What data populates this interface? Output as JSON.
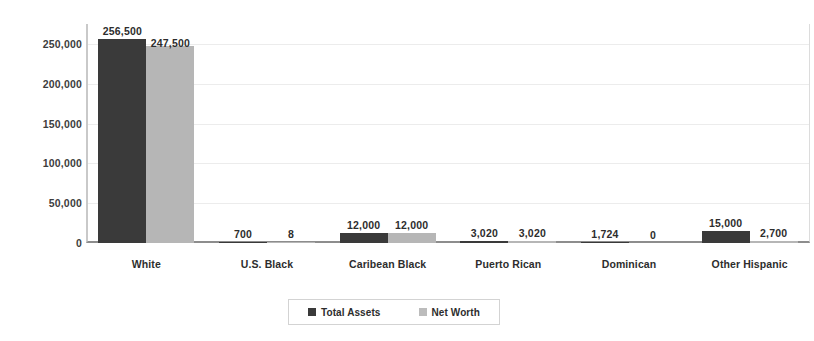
{
  "chart_data": {
    "type": "bar",
    "title": "",
    "subtitle": "",
    "xlabel": "",
    "ylabel": "",
    "ylim": [
      0,
      275000
    ],
    "yticks": [
      "0",
      "50,000",
      "100,000",
      "150,000",
      "200,000",
      "250,000"
    ],
    "ytick_values": [
      0,
      50000,
      100000,
      150000,
      200000,
      250000
    ],
    "grid": true,
    "legend_position": "bottom-center",
    "categories": [
      "White",
      "U.S. Black",
      "Caribean Black",
      "Puerto Rican",
      "Dominican",
      "Other Hispanic"
    ],
    "series": [
      {
        "name": "Total Assets",
        "color": "#3a3a3a",
        "values": [
          256500,
          700,
          12000,
          3020,
          1724,
          15000
        ],
        "labels": [
          "256,500",
          "700",
          "12,000",
          "3,020",
          "1,724",
          "15,000"
        ]
      },
      {
        "name": "Net Worth",
        "color": "#b6b6b6",
        "values": [
          247500,
          8,
          12000,
          3020,
          0,
          2700
        ],
        "labels": [
          "247,500",
          "8",
          "12,000",
          "3,020",
          "0",
          "2,700"
        ]
      }
    ]
  },
  "legend": {
    "items": [
      {
        "label": "Total Assets",
        "color": "#3a3a3a"
      },
      {
        "label": "Net Worth",
        "color": "#b6b6b6"
      }
    ]
  },
  "colors": {
    "total_assets": "#3a3a3a",
    "net_worth": "#b6b6b6",
    "gridline": "#ececec",
    "axis": "#8d8d8d",
    "background": "#ffffff"
  }
}
